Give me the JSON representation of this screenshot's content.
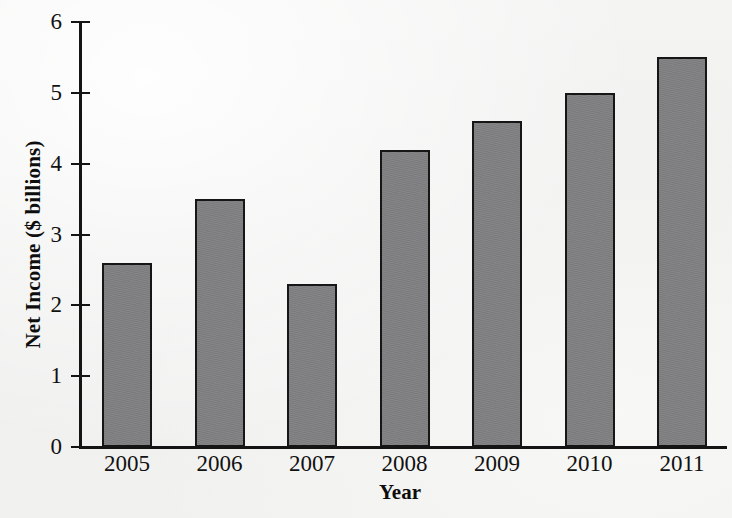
{
  "chart_data": {
    "type": "bar",
    "title": "",
    "xlabel": "Year",
    "ylabel": "Net Income ($ billions)",
    "categories": [
      "2005",
      "2006",
      "2007",
      "2008",
      "2009",
      "2010",
      "2011"
    ],
    "values": [
      2.6,
      3.5,
      2.3,
      4.2,
      4.6,
      5.0,
      5.5
    ],
    "ylim": [
      0,
      6
    ],
    "yticks": [
      "0",
      "1",
      "2",
      "3",
      "4",
      "5",
      "6"
    ],
    "ytick_values": [
      0,
      1,
      2,
      3,
      4,
      5,
      6
    ],
    "grid": false,
    "legend": "none",
    "series": [
      {
        "name": "Net Income",
        "values": [
          2.6,
          3.5,
          2.3,
          4.2,
          4.6,
          5.0,
          5.5
        ]
      }
    ],
    "colors": {
      "bar_fill": "#808082",
      "bar_edge": "#161616",
      "axis": "#141414",
      "background": "#f2f2f1",
      "text": "#111111"
    }
  }
}
